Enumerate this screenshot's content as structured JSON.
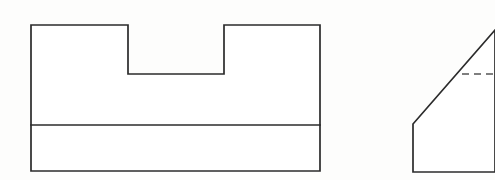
{
  "drawing": {
    "title": "Orthographic Engineering Drawing",
    "background_color": "#fdfdfc",
    "line_color": "#2b2b2b",
    "hidden_line_color": "#555555",
    "canvas": {
      "width": 495,
      "height": 180
    },
    "views": [
      {
        "name": "front-view",
        "description": "Rectangular block with a rectangular notch cut into the top edge and a horizontal division line across the lower portion",
        "outline_points": "31,25 128,25 128,74 224,74 224,25 320,25 320,171 31,171",
        "divider_line": {
          "x1": 31,
          "y1": 125,
          "x2": 320,
          "y2": 125
        },
        "bounds": {
          "left": 31,
          "top": 25,
          "right": 320,
          "bottom": 171
        },
        "notch": {
          "left": 128,
          "right": 224,
          "top": 25,
          "bottom": 74
        }
      },
      {
        "name": "side-view",
        "description": "Partial side view clipped by the right image edge, showing a chamfered corner with a dashed hidden line",
        "outline_points": "413,124 495,30 495,172 413,172",
        "chamfer_line": {
          "x1": 413,
          "y1": 124,
          "x2": 495,
          "y2": 30
        },
        "hidden_line": {
          "x1": 462,
          "y1": 74,
          "x2": 495,
          "y2": 74
        },
        "bounds": {
          "left": 413,
          "top": 30,
          "right": 495,
          "bottom": 172
        }
      }
    ]
  }
}
